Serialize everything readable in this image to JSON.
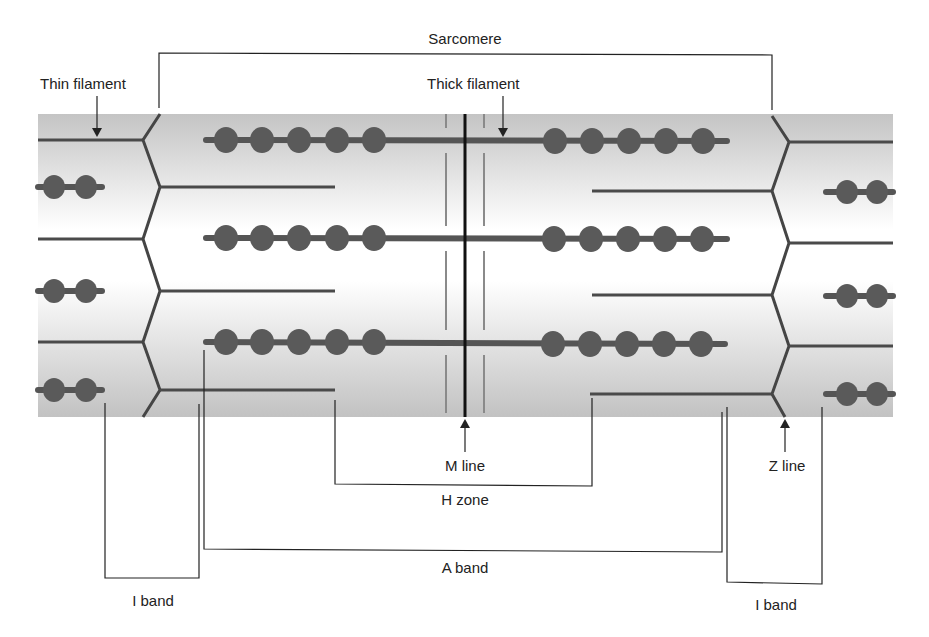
{
  "labels": {
    "sarcomere": "Sarcomere",
    "thin_filament": "Thin filament",
    "thick_filament": "Thick filament",
    "m_line": "M line",
    "h_zone": "H zone",
    "z_line": "Z line",
    "a_band": "A band",
    "i_band_left": "I band",
    "i_band_right": "I band"
  },
  "colors": {
    "band_gray": "#c6c6c6",
    "band_light": "#ffffff",
    "filament": "#4a4a4a",
    "myosin_head": "#5a5a5a",
    "m_line": "#111111",
    "text": "#222222"
  },
  "structure": {
    "thick_filaments_per_sarcomere": 3,
    "myosin_heads_per_half": 5,
    "thin_filaments_per_half": 3
  }
}
